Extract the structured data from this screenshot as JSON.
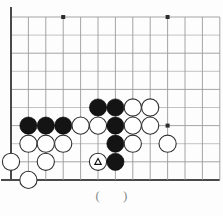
{
  "page": {
    "header_note": "",
    "caption": "(    )"
  },
  "board": {
    "type": "go-board-diagram",
    "origin_x": 11,
    "origin_y": 17,
    "spacing_x": 17.4,
    "spacing_y": 18.1,
    "cols": 13,
    "rows": 10,
    "stone_radius": 8.6,
    "edges": {
      "left": true,
      "bottom": true,
      "top": false,
      "right": false
    },
    "colors": {
      "grid": "#9a9a9a",
      "edge": "#4a4a4a",
      "black_stone": "#141414",
      "white_stone": "#ffffff",
      "white_stone_outline": "#2e2e2e",
      "background": "#fdfdfd",
      "caption_text": "#8a8a8a"
    },
    "star_points": [
      {
        "col": 3,
        "row": 0
      },
      {
        "col": 9,
        "row": 0
      },
      {
        "col": 9,
        "row": 6
      }
    ],
    "stones": [
      {
        "col": 5,
        "row": 5,
        "color": "black"
      },
      {
        "col": 6,
        "row": 5,
        "color": "black"
      },
      {
        "col": 7,
        "row": 5,
        "color": "white"
      },
      {
        "col": 8,
        "row": 5,
        "color": "white"
      },
      {
        "col": 1,
        "row": 6,
        "color": "black"
      },
      {
        "col": 2,
        "row": 6,
        "color": "black"
      },
      {
        "col": 3,
        "row": 6,
        "color": "black"
      },
      {
        "col": 4,
        "row": 6,
        "color": "white"
      },
      {
        "col": 5,
        "row": 6,
        "color": "white"
      },
      {
        "col": 6,
        "row": 6,
        "color": "black"
      },
      {
        "col": 7,
        "row": 6,
        "color": "white"
      },
      {
        "col": 8,
        "row": 6,
        "color": "white"
      },
      {
        "col": 1,
        "row": 7,
        "color": "white"
      },
      {
        "col": 2,
        "row": 7,
        "color": "white"
      },
      {
        "col": 3,
        "row": 7,
        "color": "white"
      },
      {
        "col": 6,
        "row": 7,
        "color": "black"
      },
      {
        "col": 7,
        "row": 7,
        "color": "white"
      },
      {
        "col": 9,
        "row": 7,
        "color": "white"
      },
      {
        "col": 0,
        "row": 8,
        "color": "white"
      },
      {
        "col": 2,
        "row": 8,
        "color": "white"
      },
      {
        "col": 5,
        "row": 8,
        "color": "white",
        "mark": "triangle"
      },
      {
        "col": 6,
        "row": 8,
        "color": "black"
      },
      {
        "col": 1,
        "row": 9,
        "color": "white"
      }
    ]
  }
}
